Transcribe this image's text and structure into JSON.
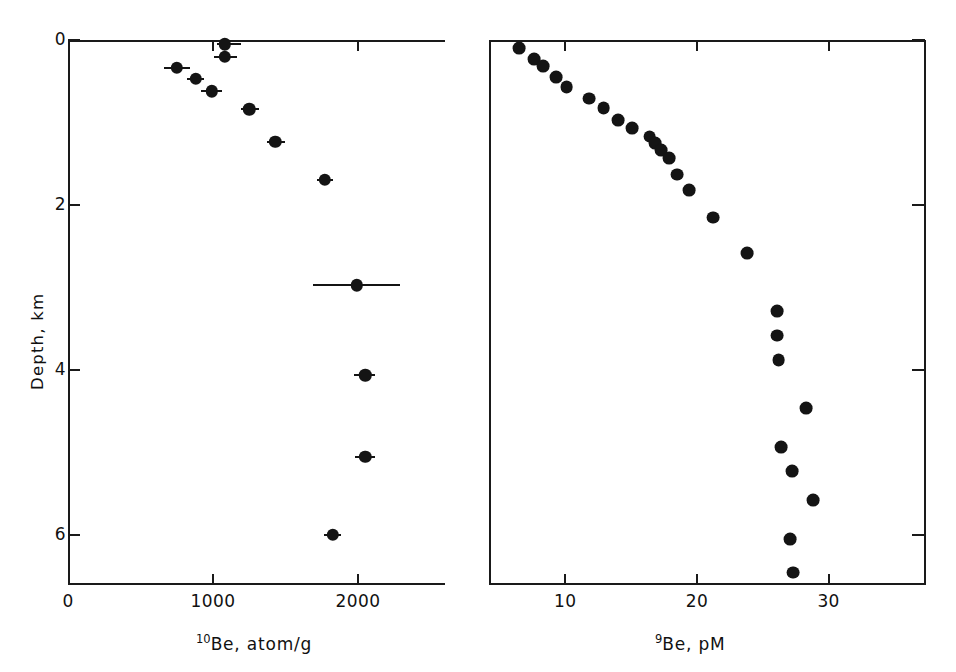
{
  "figure": {
    "width": 956,
    "height": 672,
    "background": "#ffffff",
    "marker_color": "#141414",
    "axis_color": "#1a1a1a"
  },
  "axes": {
    "y": {
      "label": "Depth, km",
      "ticks": [
        0,
        2,
        4,
        6
      ],
      "tick_labels": [
        "0",
        "2",
        "4",
        "6"
      ],
      "range": [
        0,
        6.6
      ],
      "units": "km",
      "direction": "inverted"
    }
  },
  "chart_data": [
    {
      "id": "left-panel",
      "type": "scatter",
      "title": "",
      "xlabel": "10Be, atom/g",
      "xlabel_sup": "10",
      "xlabel_rest": "Be, atom/g",
      "ylabel": "Depth, km",
      "xlim": [
        0,
        2600
      ],
      "ylim": [
        0,
        6.6
      ],
      "xticks": [
        0,
        1000,
        2000
      ],
      "xtick_labels": [
        "0",
        "1000",
        "2000"
      ],
      "yticks": [
        0,
        2,
        4,
        6
      ],
      "ytick_labels": [
        "0",
        "2",
        "4",
        "6"
      ],
      "grid": false,
      "legend": "none",
      "error_bars": "x",
      "points": [
        {
          "x": 1080,
          "y": 0.05,
          "xerr_low": 1025,
          "xerr_high": 1190
        },
        {
          "x": 1080,
          "y": 0.2,
          "xerr_low": 1010,
          "xerr_high": 1165
        },
        {
          "x": 750,
          "y": 0.34,
          "xerr_low": 660,
          "xerr_high": 840
        },
        {
          "x": 880,
          "y": 0.47,
          "xerr_low": 820,
          "xerr_high": 940
        },
        {
          "x": 990,
          "y": 0.62,
          "xerr_low": 920,
          "xerr_high": 1060
        },
        {
          "x": 1250,
          "y": 0.84,
          "xerr_low": 1190,
          "xerr_high": 1320
        },
        {
          "x": 1430,
          "y": 1.23,
          "xerr_low": 1370,
          "xerr_high": 1500
        },
        {
          "x": 1770,
          "y": 1.69,
          "xerr_low": 1720,
          "xerr_high": 1830
        },
        {
          "x": 1990,
          "y": 2.97,
          "xerr_low": 1690,
          "xerr_high": 2290
        },
        {
          "x": 2050,
          "y": 4.06,
          "xerr_low": 1970,
          "xerr_high": 2120
        },
        {
          "x": 2050,
          "y": 5.05,
          "xerr_low": 1980,
          "xerr_high": 2115
        },
        {
          "x": 1825,
          "y": 5.99,
          "xerr_low": 1765,
          "xerr_high": 1885
        }
      ]
    },
    {
      "id": "right-panel",
      "type": "scatter",
      "title": "",
      "xlabel": "9Be, pM",
      "xlabel_sup": "9",
      "xlabel_rest": "Be, pM",
      "ylabel": "Depth, km",
      "xlim": [
        4.2,
        37.4
      ],
      "ylim": [
        0,
        6.6
      ],
      "xticks": [
        10,
        20,
        30
      ],
      "xtick_labels": [
        "10",
        "20",
        "30"
      ],
      "yticks": [
        0,
        2,
        4,
        6
      ],
      "ytick_labels": [
        "0",
        "2",
        "4",
        "6"
      ],
      "grid": false,
      "legend": "none",
      "error_bars": "none",
      "points": [
        {
          "x": 6.5,
          "y": 0.1
        },
        {
          "x": 7.6,
          "y": 0.23
        },
        {
          "x": 8.3,
          "y": 0.32
        },
        {
          "x": 9.3,
          "y": 0.45
        },
        {
          "x": 10.1,
          "y": 0.57
        },
        {
          "x": 11.8,
          "y": 0.71
        },
        {
          "x": 12.9,
          "y": 0.82
        },
        {
          "x": 14.0,
          "y": 0.97
        },
        {
          "x": 15.1,
          "y": 1.07
        },
        {
          "x": 16.4,
          "y": 1.17
        },
        {
          "x": 16.8,
          "y": 1.25
        },
        {
          "x": 17.3,
          "y": 1.33
        },
        {
          "x": 17.9,
          "y": 1.43
        },
        {
          "x": 18.5,
          "y": 1.63
        },
        {
          "x": 19.4,
          "y": 1.82
        },
        {
          "x": 21.2,
          "y": 2.15
        },
        {
          "x": 23.8,
          "y": 2.58
        },
        {
          "x": 26.1,
          "y": 3.28
        },
        {
          "x": 26.1,
          "y": 3.58
        },
        {
          "x": 26.2,
          "y": 3.88
        },
        {
          "x": 28.3,
          "y": 4.46
        },
        {
          "x": 26.4,
          "y": 4.93
        },
        {
          "x": 27.2,
          "y": 5.22
        },
        {
          "x": 28.8,
          "y": 5.57
        },
        {
          "x": 27.1,
          "y": 6.04
        },
        {
          "x": 27.3,
          "y": 6.45
        }
      ]
    }
  ]
}
